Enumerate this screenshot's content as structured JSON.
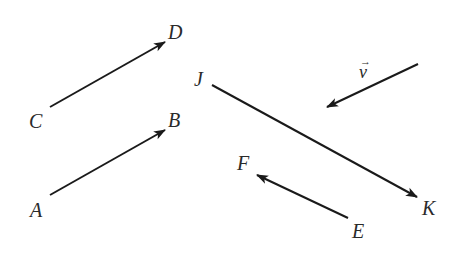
{
  "diagram": {
    "stroke_color": "#1a1a1a",
    "label_color": "#2a2a2a",
    "background": "#ffffff",
    "vectors": [
      {
        "id": "CD",
        "tail_label": "C",
        "head_label": "D",
        "tail": [
          50,
          107
        ],
        "head": [
          165,
          42
        ]
      },
      {
        "id": "AB",
        "tail_label": "A",
        "head_label": "B",
        "tail": [
          50,
          195
        ],
        "head": [
          165,
          130
        ]
      },
      {
        "id": "JK",
        "tail_label": "J",
        "head_label": "K",
        "tail": [
          212,
          85
        ],
        "head": [
          417,
          197
        ]
      },
      {
        "id": "EF",
        "tail_label": "E",
        "head_label": "F",
        "tail": [
          348,
          218
        ],
        "head": [
          257,
          175
        ]
      },
      {
        "id": "v",
        "label": "v",
        "label_accent": "→",
        "tail": [
          418,
          64
        ],
        "head": [
          327,
          107
        ]
      }
    ],
    "labels": {
      "C": "C",
      "D": "D",
      "A": "A",
      "B": "B",
      "J": "J",
      "K": "K",
      "E": "E",
      "F": "F",
      "v": "v",
      "v_arrow": "→"
    }
  }
}
